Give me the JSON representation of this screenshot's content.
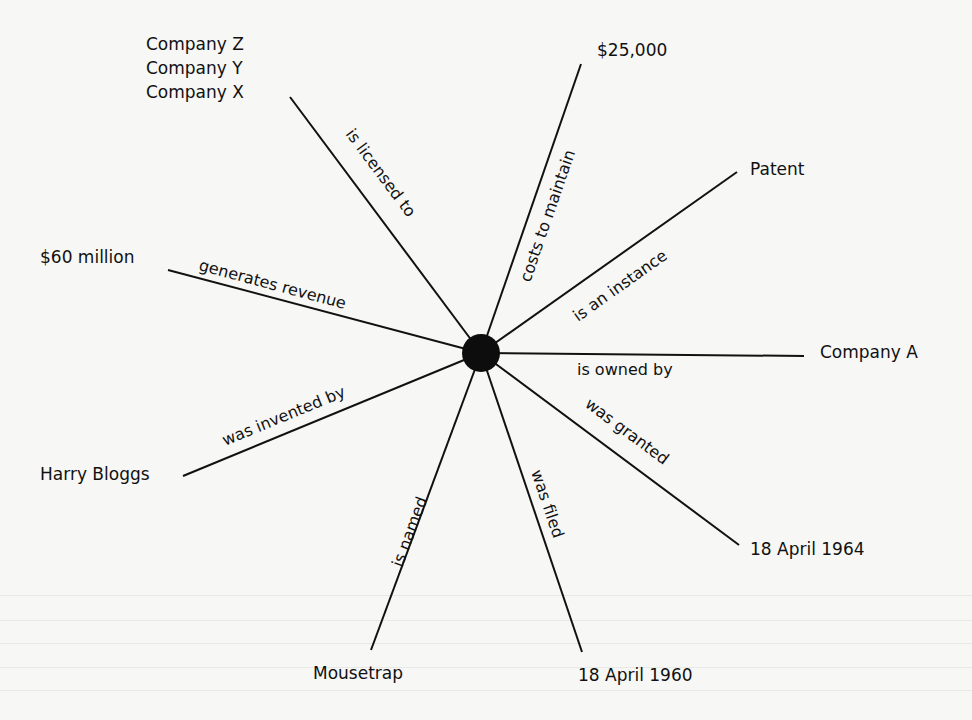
{
  "diagram": {
    "type": "semantic-network",
    "center": {
      "x": 481,
      "y": 353,
      "r": 19,
      "color": "#0d0d0d"
    },
    "edges": [
      {
        "label": "is licensed to",
        "x2": 290,
        "y2": 97
      },
      {
        "label": "costs to maintain",
        "x2": 581,
        "y2": 64
      },
      {
        "label": "is an instance",
        "x2": 737,
        "y2": 172
      },
      {
        "label": "generates revenue",
        "x2": 168,
        "y2": 270
      },
      {
        "label": "is owned by",
        "x2": 804,
        "y2": 356
      },
      {
        "label": "was invented by",
        "x2": 183,
        "y2": 476
      },
      {
        "label": "was granted",
        "x2": 739,
        "y2": 545
      },
      {
        "label": "is named",
        "x2": 371,
        "y2": 650
      },
      {
        "label": "was filed",
        "x2": 582,
        "y2": 652
      }
    ],
    "nodes": [
      {
        "id": "companies",
        "lines": [
          "Company Z",
          "Company Y",
          "Company X"
        ],
        "x": 146,
        "y": 34
      },
      {
        "id": "cost",
        "lines": [
          "$25,000"
        ],
        "x": 597,
        "y": 39
      },
      {
        "id": "patent",
        "lines": [
          "Patent"
        ],
        "x": 750,
        "y": 158
      },
      {
        "id": "revenue",
        "lines": [
          "$60 million"
        ],
        "x": 40,
        "y": 246
      },
      {
        "id": "owner",
        "lines": [
          "Company A"
        ],
        "x": 820,
        "y": 341
      },
      {
        "id": "inventor",
        "lines": [
          "Harry Bloggs"
        ],
        "x": 40,
        "y": 463
      },
      {
        "id": "granted-date",
        "lines": [
          "18 April 1964"
        ],
        "x": 750,
        "y": 538
      },
      {
        "id": "name",
        "lines": [
          "Mousetrap"
        ],
        "x": 313,
        "y": 662
      },
      {
        "id": "filed-date",
        "lines": [
          "18 April 1960"
        ],
        "x": 578,
        "y": 664
      }
    ]
  },
  "labels": {
    "company_z": "Company Z",
    "company_y": "Company Y",
    "company_x": "Company X",
    "cost": "$25,000",
    "patent": "Patent",
    "revenue": "$60 million",
    "owner": "Company A",
    "inventor": "Harry Bloggs",
    "granted_date": "18 April 1964",
    "name": "Mousetrap",
    "filed_date": "18 April 1960",
    "edge_licensed": "is licensed to",
    "edge_costs": "costs to maintain",
    "edge_instance": "is an instance",
    "edge_revenue": "generates revenue",
    "edge_owned": "is owned by",
    "edge_invented": "was invented by",
    "edge_granted": "was granted",
    "edge_named": "is named",
    "edge_filed": "was filed"
  }
}
